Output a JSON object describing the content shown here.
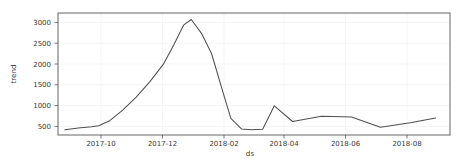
{
  "figure": {
    "background_color": "#ffffff",
    "plot_area": {
      "left": 58,
      "top": 13,
      "right": 450,
      "bottom": 135
    },
    "line_color": "#4f4f4f",
    "grid_color": "#f2f2f4",
    "axis_color": "#555555"
  },
  "chart_data": {
    "type": "line",
    "title": "",
    "xlabel": "ds",
    "ylabel": "trend",
    "grid": true,
    "legend": null,
    "xlim": [
      "2017-08-20",
      "2018-09-30"
    ],
    "ylim": [
      380,
      3180
    ],
    "ytick_labels": [
      "500",
      "1000",
      "1500",
      "2000",
      "2500",
      "3000"
    ],
    "yticks": [
      500,
      1000,
      1500,
      2000,
      2500,
      3000
    ],
    "xtick_labels": [
      "2017-10",
      "2017-12",
      "2018-02",
      "2018-04",
      "2018-06",
      "2018-08"
    ],
    "xticks": [
      "2017-10-01",
      "2017-12-01",
      "2018-02-01",
      "2018-04-01",
      "2018-06-01",
      "2018-08-01"
    ],
    "series": [
      {
        "name": "trend",
        "x": [
          "2017-08-27",
          "2017-09-10",
          "2017-09-24",
          "2017-10-01",
          "2017-10-12",
          "2017-10-26",
          "2017-11-09",
          "2017-11-23",
          "2017-12-07",
          "2017-12-18",
          "2017-12-28",
          "2018-01-05",
          "2018-01-16",
          "2018-01-26",
          "2018-02-05",
          "2018-02-15",
          "2018-02-26",
          "2018-03-08",
          "2018-03-20",
          "2018-04-01",
          "2018-04-20",
          "2018-05-20",
          "2018-06-10",
          "2018-06-20",
          "2018-07-20",
          "2018-08-20",
          "2018-09-15"
        ],
        "values": [
          500,
          540,
          570,
          590,
          700,
          950,
          1250,
          1600,
          2000,
          2450,
          2900,
          3030,
          2700,
          2250,
          1500,
          760,
          520,
          500,
          510,
          1050,
          690,
          810,
          800,
          795,
          560,
          660,
          770
        ]
      }
    ]
  }
}
